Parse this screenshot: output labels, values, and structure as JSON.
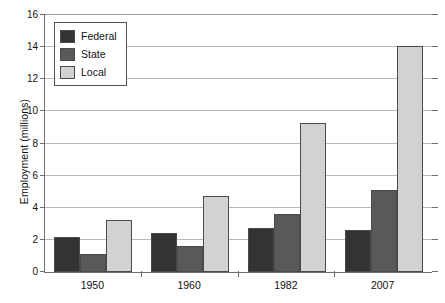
{
  "chart_data": {
    "type": "bar",
    "title": "",
    "subtitle": "",
    "xlabel": "",
    "ylabel": "Employment (millions)",
    "categories": [
      "1950",
      "1960",
      "1982",
      "2007"
    ],
    "series": [
      {
        "name": "Federal",
        "color": "#333333",
        "values": [
          2.2,
          2.4,
          2.75,
          2.6
        ]
      },
      {
        "name": "State",
        "color": "#595959",
        "values": [
          1.1,
          1.65,
          3.6,
          5.1
        ]
      },
      {
        "name": "Local",
        "color": "#d2d2d2",
        "values": [
          3.25,
          4.75,
          9.25,
          14.1
        ]
      }
    ],
    "ylim": [
      0,
      16
    ],
    "y_ticks": [
      0,
      2,
      4,
      6,
      8,
      10,
      12,
      14,
      16
    ],
    "y_tick_labels": [
      "0",
      "2",
      "4",
      "6",
      "8",
      "10",
      "12",
      "14",
      "16"
    ],
    "grid": true,
    "legend_position": "top-left",
    "legend_entries": [
      "Federal",
      "State",
      "Local"
    ]
  },
  "axis": {
    "y_title": "Employment (millions)"
  }
}
